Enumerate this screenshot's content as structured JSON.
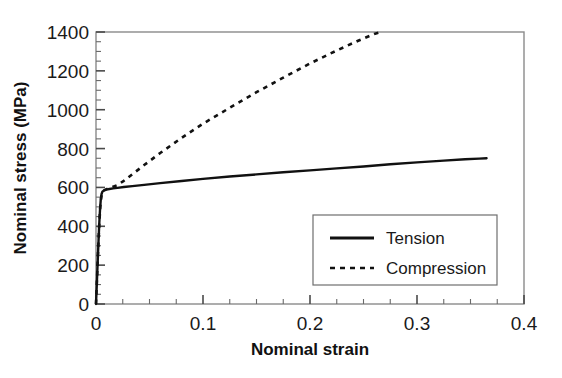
{
  "chart_data": {
    "type": "line",
    "title": "",
    "xlabel": "Nominal strain",
    "ylabel": "Nominal stress (MPa)",
    "xlim": [
      0,
      0.4
    ],
    "ylim": [
      0,
      1400
    ],
    "xticks": [
      0,
      0.1,
      0.2,
      0.3,
      0.4
    ],
    "xtick_labels": [
      "0",
      "0.1",
      "0.2",
      "0.3",
      "0.4"
    ],
    "yticks": [
      0,
      200,
      400,
      600,
      800,
      1000,
      1200,
      1400
    ],
    "ytick_labels": [
      "0",
      "200",
      "400",
      "600",
      "800",
      "1000",
      "1200",
      "1400"
    ],
    "x_minor_step": 0.025,
    "y_minor_step": 50,
    "grid": false,
    "legend_position": "lower right",
    "series": [
      {
        "name": "Tension",
        "style": "solid",
        "color": "#111111",
        "points": [
          [
            0.0,
            0
          ],
          [
            0.0008,
            110
          ],
          [
            0.0016,
            220
          ],
          [
            0.0024,
            330
          ],
          [
            0.0031,
            420
          ],
          [
            0.0038,
            490
          ],
          [
            0.0045,
            540
          ],
          [
            0.0052,
            566
          ],
          [
            0.006,
            578
          ],
          [
            0.0075,
            585
          ],
          [
            0.0095,
            589
          ],
          [
            0.0125,
            592
          ],
          [
            0.016,
            595
          ],
          [
            0.02,
            598
          ],
          [
            0.026,
            602
          ],
          [
            0.034,
            607
          ],
          [
            0.045,
            613
          ],
          [
            0.06,
            622
          ],
          [
            0.08,
            633
          ],
          [
            0.1,
            644
          ],
          [
            0.125,
            656
          ],
          [
            0.15,
            667
          ],
          [
            0.175,
            678
          ],
          [
            0.2,
            688
          ],
          [
            0.225,
            698
          ],
          [
            0.25,
            708
          ],
          [
            0.275,
            719
          ],
          [
            0.3,
            729
          ],
          [
            0.325,
            738
          ],
          [
            0.345,
            745
          ],
          [
            0.358,
            748
          ],
          [
            0.365,
            750
          ]
        ]
      },
      {
        "name": "Compression",
        "style": "dashed",
        "color": "#111111",
        "points": [
          [
            0.0,
            0
          ],
          [
            0.001,
            140
          ],
          [
            0.002,
            280
          ],
          [
            0.003,
            405
          ],
          [
            0.004,
            500
          ],
          [
            0.005,
            552
          ],
          [
            0.006,
            575
          ],
          [
            0.008,
            586
          ],
          [
            0.011,
            594
          ],
          [
            0.015,
            601
          ],
          [
            0.02,
            612
          ],
          [
            0.026,
            634
          ],
          [
            0.034,
            668
          ],
          [
            0.045,
            715
          ],
          [
            0.06,
            777
          ],
          [
            0.08,
            855
          ],
          [
            0.1,
            928
          ],
          [
            0.125,
            1010
          ],
          [
            0.15,
            1090
          ],
          [
            0.175,
            1165
          ],
          [
            0.2,
            1238
          ],
          [
            0.225,
            1305
          ],
          [
            0.245,
            1355
          ],
          [
            0.26,
            1390
          ],
          [
            0.267,
            1400
          ]
        ]
      }
    ],
    "annotations": []
  },
  "legend": {
    "entries": [
      {
        "label": "Tension",
        "style": "solid"
      },
      {
        "label": "Compression",
        "style": "dashed"
      }
    ]
  }
}
